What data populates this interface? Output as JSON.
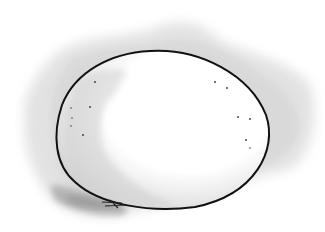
{
  "image": {
    "subject": "egg illustration",
    "description": "Pen-and-ink egg outline with grey watercolor wash background and shadow",
    "colors": {
      "background": "#ffffff",
      "wash": "#d6d6d6",
      "wash_light": "#e6e6e6",
      "shadow": "#a8a8a8",
      "outline": "#111111",
      "shell": "#ffffff",
      "shell_shade": "#dcdcdc"
    }
  }
}
